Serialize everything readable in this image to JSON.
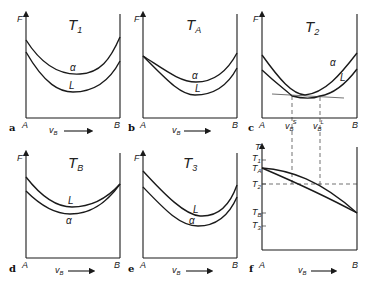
{
  "panels": [
    {
      "id": "a",
      "title": "T1",
      "title_main": "T",
      "title_sub": "1",
      "curves": [
        {
          "label": "α",
          "role": "upper"
        },
        {
          "label": "L",
          "role": "lower"
        }
      ],
      "y_axis": "F",
      "x_axis": "vB",
      "left": "A",
      "right": "B"
    },
    {
      "id": "b",
      "title": "TA",
      "title_main": "T",
      "title_sub": "A",
      "curves": [
        {
          "label": "α",
          "role": "upper"
        },
        {
          "label": "L",
          "role": "lower"
        }
      ],
      "y_axis": "F",
      "x_axis": "vB",
      "left": "A",
      "right": "B"
    },
    {
      "id": "c",
      "title": "T2",
      "title_main": "T",
      "title_sub": "2",
      "curves": [
        {
          "label": "α"
        },
        {
          "label": "L"
        }
      ],
      "y_axis": "F",
      "left": "A",
      "right": "B",
      "x_marks": [
        {
          "main": "v",
          "sub": "B",
          "sup": "S"
        },
        {
          "main": "v",
          "sub": "B",
          "sup": "L"
        }
      ]
    },
    {
      "id": "d",
      "title": "TB",
      "title_main": "T",
      "title_sub": "B",
      "curves": [
        {
          "label": "L",
          "role": "upper"
        },
        {
          "label": "α",
          "role": "lower"
        }
      ],
      "y_axis": "F",
      "x_axis": "vB",
      "left": "A",
      "right": "B"
    },
    {
      "id": "e",
      "title": "T3",
      "title_main": "T",
      "title_sub": "3",
      "curves": [
        {
          "label": "L",
          "role": "upper"
        },
        {
          "label": "α",
          "role": "lower"
        }
      ],
      "y_axis": "F",
      "x_axis": "vB",
      "left": "A",
      "right": "B"
    },
    {
      "id": "f",
      "title": "",
      "y_axis": "T",
      "x_axis": "vB",
      "left": "A",
      "right": "B",
      "y_ticks": [
        {
          "main": "T",
          "sub": "1"
        },
        {
          "main": "T",
          "sub": "A"
        },
        {
          "main": "T",
          "sub": "2"
        },
        {
          "main": "T",
          "sub": "B"
        },
        {
          "main": "T",
          "sub": "3"
        }
      ]
    }
  ],
  "labels": {
    "a": "a",
    "b": "b",
    "c": "c",
    "d": "d",
    "e": "e",
    "f": "f",
    "A": "A",
    "B": "B",
    "F": "F",
    "T": "T",
    "v": "v",
    "B_sub": "B",
    "alpha": "α",
    "L": "L",
    "T_main": "T"
  }
}
